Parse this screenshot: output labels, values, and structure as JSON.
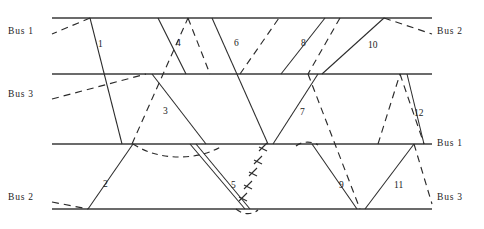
{
  "figure": {
    "type": "space-time-schedule-diagram",
    "width": 484,
    "height": 229,
    "background": "#ffffff",
    "stroke_color": "#2b2b2b",
    "bus_line_color": "#3a3a3a"
  },
  "bus_lines": [
    {
      "id": "line-top",
      "y": 18,
      "x1": 52,
      "x2": 432
    },
    {
      "id": "line-second",
      "y": 74,
      "x1": 52,
      "x2": 432
    },
    {
      "id": "line-third",
      "y": 144,
      "x1": 52,
      "x2": 432
    },
    {
      "id": "line-bottom",
      "y": 209,
      "x1": 52,
      "x2": 432
    }
  ],
  "left_labels": [
    {
      "name": "bus-label-left-1",
      "text": "Bus 1",
      "x": 8,
      "y": 27
    },
    {
      "name": "bus-label-left-3",
      "text": "Bus 3",
      "x": 8,
      "y": 90
    },
    {
      "name": "bus-label-left-2",
      "text": "Bus 2",
      "x": 8,
      "y": 193
    }
  ],
  "right_labels": [
    {
      "name": "bus-label-right-2",
      "text": "Bus 2",
      "x": 437,
      "y": 27
    },
    {
      "name": "bus-label-right-1",
      "text": "Bus 1",
      "x": 437,
      "y": 139
    },
    {
      "name": "bus-label-right-3",
      "text": "Bus 3",
      "x": 437,
      "y": 193
    }
  ],
  "segment_numbers": [
    {
      "label": "1",
      "x": 98,
      "y": 45
    },
    {
      "label": "2",
      "x": 103,
      "y": 185
    },
    {
      "label": "3",
      "x": 163,
      "y": 112
    },
    {
      "label": "4",
      "x": 176,
      "y": 44
    },
    {
      "label": "5",
      "x": 231,
      "y": 186
    },
    {
      "label": "6",
      "x": 234,
      "y": 44
    },
    {
      "label": "7",
      "x": 300,
      "y": 113
    },
    {
      "label": "8",
      "x": 301,
      "y": 44
    },
    {
      "label": "9",
      "x": 339,
      "y": 186
    },
    {
      "label": "10",
      "x": 368,
      "y": 46
    },
    {
      "label": "11",
      "x": 394,
      "y": 186
    },
    {
      "label": "12",
      "x": 414,
      "y": 114
    }
  ],
  "solid_paths": [
    {
      "name": "path-1",
      "points": "90,18 122,144"
    },
    {
      "name": "path-2",
      "points": "88,209 133,144"
    },
    {
      "name": "path-3",
      "points": "152,74 206,144"
    },
    {
      "name": "path-4",
      "points": "158,18 186,74"
    },
    {
      "name": "path-5a",
      "points": "190,144 245,209"
    },
    {
      "name": "path-5b",
      "points": "196,144 250,209"
    },
    {
      "name": "path-6",
      "points": "212,18 268,144"
    },
    {
      "name": "path-7",
      "points": "273,144 318,74"
    },
    {
      "name": "path-8",
      "points": "281,74 325,18"
    },
    {
      "name": "path-9",
      "points": "312,144 357,209"
    },
    {
      "name": "path-10",
      "points": "322,74 384,18"
    },
    {
      "name": "path-11",
      "points": "365,209 414,144"
    },
    {
      "name": "path-12",
      "points": "407,74 424,144"
    }
  ],
  "dashed_paths": [
    {
      "name": "dashed-a",
      "points": "90,18 52,34"
    },
    {
      "name": "dashed-b",
      "points": "52,99 146,74"
    },
    {
      "name": "dashed-c",
      "points": "132,144 188,18"
    },
    {
      "name": "dashed-d",
      "points": "188,18 210,74"
    },
    {
      "name": "dashed-e",
      "points": "240,74 279,18"
    },
    {
      "name": "dashed-f",
      "points": "340,18 308,74"
    },
    {
      "name": "dashed-g",
      "points": "308,74 360,209"
    },
    {
      "name": "dashed-h",
      "points": "384,18 432,34"
    },
    {
      "name": "dashed-i",
      "points": "378,144 400,74"
    },
    {
      "name": "dashed-j",
      "points": "400,74 424,144"
    },
    {
      "name": "dashed-k",
      "points": "52,202 88,209"
    },
    {
      "name": "dashed-l",
      "points": "414,144 432,204"
    }
  ],
  "dashed_curves": [
    {
      "name": "curve-bus2-arc",
      "d": "M 133,144 C 160,162 200,160 222,146"
    },
    {
      "name": "curve-bottom-arc",
      "d": "M 236,209 C 243,215 252,215 258,210"
    },
    {
      "name": "curve-mid-arc",
      "d": "M 296,146 C 302,141 312,141 318,145"
    }
  ],
  "tick_path": {
    "name": "tick-dashed-path",
    "points": "239,207 271,135",
    "ticks": [
      {
        "x": 243,
        "y": 197
      },
      {
        "x": 248,
        "y": 185
      },
      {
        "x": 253,
        "y": 172
      },
      {
        "x": 258,
        "y": 160
      },
      {
        "x": 263,
        "y": 147
      }
    ]
  }
}
